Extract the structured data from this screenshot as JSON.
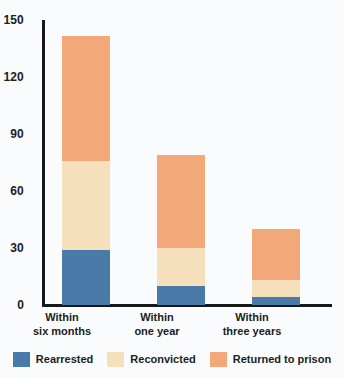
{
  "chart_data": {
    "type": "bar",
    "subtype": "stacked-bar",
    "title": "",
    "subtitle": "",
    "xlabel": "",
    "ylabel": "",
    "categories": [
      "Within six months",
      "Within one year",
      "Within three years"
    ],
    "category_lines": [
      [
        "Within",
        "six months"
      ],
      [
        "Within",
        "one year"
      ],
      [
        "Within",
        "three years"
      ]
    ],
    "series": [
      {
        "name": "Rearrested",
        "color": "#4a7ba8",
        "values": [
          29,
          10,
          4
        ]
      },
      {
        "name": "Reconvicted",
        "color": "#f6e0bc",
        "values": [
          47,
          20,
          9
        ]
      },
      {
        "name": "Returned to prison",
        "color": "#f2a878",
        "values": [
          66,
          49,
          27
        ]
      }
    ],
    "totals": [
      142,
      79,
      40
    ],
    "ylim": [
      0,
      150
    ],
    "yticks": [
      0,
      30,
      60,
      90,
      120,
      150
    ],
    "ytick_labels": [
      "0",
      "30",
      "60",
      "90",
      "120",
      "150"
    ],
    "grid": false,
    "legend_position": "bottom",
    "background_color": "#fafbfc",
    "axis_color": "#16181a"
  }
}
